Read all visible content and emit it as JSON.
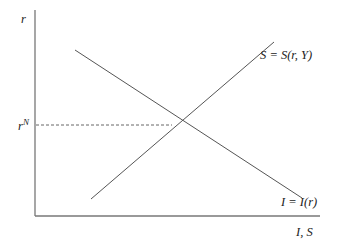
{
  "diagram": {
    "y_axis_label": "r",
    "x_axis_label": "I, S",
    "equilibrium_label_base": "r",
    "equilibrium_label_sup": "N",
    "curves": [
      {
        "name": "saving",
        "label": "S = S(r, Y)",
        "slope": "upward"
      },
      {
        "name": "investment",
        "label": "I = I(r)",
        "slope": "downward"
      }
    ],
    "colors": {
      "axis": "#777777",
      "line": "#555555",
      "text": "#222222"
    }
  }
}
